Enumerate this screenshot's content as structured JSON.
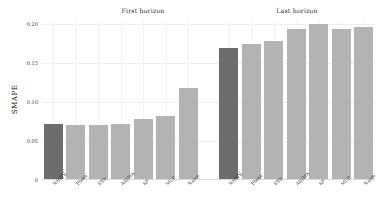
{
  "chart_data": {
    "type": "bar",
    "title": "",
    "xlabel": "",
    "ylabel": "SMAPE",
    "ylim": [
      0,
      0.205
    ],
    "yticks": [
      0,
      0.05,
      0.1,
      0.15,
      0.2
    ],
    "ytick_labels": [
      "0",
      "0.05",
      "0.10",
      "0.15",
      "0.20"
    ],
    "grid": true,
    "legend": "none",
    "panels": [
      {
        "id": "first-horizon",
        "title": "First horizon",
        "categories": [
          "NHITS",
          "Theta",
          "ETS",
          "ARIMA",
          "RF",
          "MLP",
          "Naive"
        ],
        "values": [
          0.07,
          0.069,
          0.069,
          0.07,
          0.077,
          0.081,
          0.116
        ],
        "highlight_index": 0
      },
      {
        "id": "last-horizon",
        "title": "Last horizon",
        "categories": [
          "NHITS",
          "Theta",
          "ETS",
          "ARIMA",
          "RF",
          "MLP",
          "Naive"
        ],
        "values": [
          0.168,
          0.173,
          0.177,
          0.192,
          0.198,
          0.192,
          0.195
        ],
        "highlight_index": 0
      }
    ],
    "colors": {
      "bar": "#b3b3b3",
      "bar_highlight": "#6d6d6d",
      "grid": "#eceff1",
      "axis": "#d8dadc",
      "text": "#2b2b2b",
      "background": "#ffffff"
    }
  }
}
